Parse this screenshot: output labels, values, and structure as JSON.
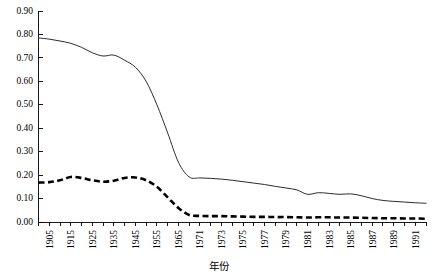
{
  "chart_data": {
    "type": "line",
    "title": "",
    "xlabel": "年份",
    "ylabel": "",
    "ylim": [
      0.0,
      0.9
    ],
    "ytick_step": 0.1,
    "grid": false,
    "legend": "none",
    "ytick_labels": [
      "0.00",
      "0.10",
      "0.20",
      "0.30",
      "0.40",
      "0.50",
      "0.60",
      "0.70",
      "0.80",
      "0.90"
    ],
    "ytick_values": [
      0.0,
      0.1,
      0.2,
      0.3,
      0.4,
      0.5,
      0.6,
      0.7,
      0.8,
      0.9
    ],
    "x": [
      "1900",
      "1905",
      "1910",
      "1915",
      "1920",
      "1925",
      "1930",
      "1935",
      "1940",
      "1945",
      "1950",
      "1955",
      "1960",
      "1965",
      "1969",
      "1971",
      "1972",
      "1973",
      "1974",
      "1975",
      "1976",
      "1977",
      "1978",
      "1979",
      "1980",
      "1981",
      "1982",
      "1983",
      "1984",
      "1985",
      "1986",
      "1987",
      "1988",
      "1989",
      "1990",
      "1991",
      "1992"
    ],
    "xtick_labels": [
      "",
      "1905",
      "",
      "1915",
      "",
      "1925",
      "",
      "1935",
      "",
      "1945",
      "",
      "1955",
      "",
      "1965",
      "",
      "1971",
      "",
      "1973",
      "",
      "1975",
      "",
      "1977",
      "",
      "1979",
      "",
      "1981",
      "",
      "1983",
      "",
      "1985",
      "",
      "1987",
      "",
      "1989",
      "",
      "1991",
      ""
    ],
    "series": [
      {
        "name": "solid-series",
        "style": "solid",
        "color": "#2b2b2b",
        "values": [
          0.785,
          0.78,
          0.772,
          0.762,
          0.745,
          0.722,
          0.708,
          0.712,
          0.69,
          0.66,
          0.6,
          0.5,
          0.38,
          0.255,
          0.192,
          0.188,
          0.186,
          0.183,
          0.178,
          0.172,
          0.166,
          0.16,
          0.152,
          0.145,
          0.137,
          0.118,
          0.125,
          0.122,
          0.118,
          0.12,
          0.112,
          0.1,
          0.092,
          0.088,
          0.085,
          0.082,
          0.08
        ]
      },
      {
        "name": "dashed-series",
        "style": "dashed",
        "color": "#000000",
        "values": [
          0.168,
          0.17,
          0.178,
          0.192,
          0.188,
          0.178,
          0.172,
          0.176,
          0.188,
          0.19,
          0.178,
          0.15,
          0.105,
          0.06,
          0.03,
          0.026,
          0.025,
          0.025,
          0.024,
          0.023,
          0.022,
          0.022,
          0.021,
          0.021,
          0.02,
          0.019,
          0.02,
          0.02,
          0.019,
          0.019,
          0.018,
          0.017,
          0.016,
          0.016,
          0.015,
          0.015,
          0.014
        ]
      }
    ]
  },
  "axis": {
    "x_title": "年份"
  }
}
